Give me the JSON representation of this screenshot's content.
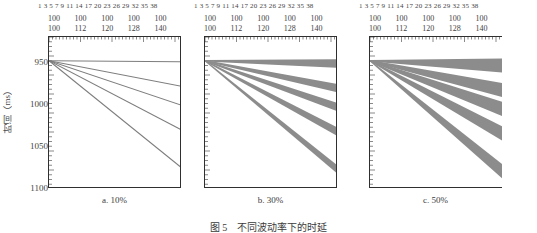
{
  "figure": {
    "title": "图 5　不同波动率下的时延",
    "y_axis_label": "时间（ms）",
    "y_ticks": [
      "950",
      "1000",
      "1050",
      "1100"
    ],
    "y_tick_values": [
      950,
      1000,
      1050,
      1100
    ],
    "top_index_row": "1 3 5 7 9 11 14 17 20 23 26 29 32 35 38",
    "top_row_a": [
      "100",
      "100",
      "100",
      "100",
      "100"
    ],
    "top_row_b": [
      "100",
      "112",
      "120",
      "128",
      "140"
    ],
    "panels": [
      {
        "caption": "a. 10%",
        "percent": "10%"
      },
      {
        "caption": "b. 30%",
        "percent": "30%"
      },
      {
        "caption": "c. 50%",
        "percent": "50%"
      }
    ]
  },
  "chart_data": {
    "type": "line",
    "title": "图 5　不同波动率下的时延",
    "xlabel": "",
    "ylabel": "时间（ms）",
    "ylim": [
      1100,
      940
    ],
    "y_ticks": [
      950,
      1000,
      1050,
      1100
    ],
    "x": [
      0,
      1
    ],
    "xlim": [
      0,
      1
    ],
    "grid": false,
    "legend": "none",
    "band_color": "#8c8c8c",
    "line_color": "#7d7d7d",
    "panels": [
      {
        "name": "a. 10%",
        "volatility": "10%",
        "band_half_width_ms": 1.2,
        "series": [
          {
            "name": "s1",
            "start": 965,
            "end": 966
          },
          {
            "name": "s2",
            "start": 965,
            "end": 992
          },
          {
            "name": "s3",
            "start": 965,
            "end": 1012
          },
          {
            "name": "s4",
            "start": 965,
            "end": 1038
          },
          {
            "name": "s5",
            "start": 965,
            "end": 1078
          }
        ]
      },
      {
        "name": "b. 30%",
        "volatility": "30%",
        "band_half_width_ms": 4.5,
        "series": [
          {
            "name": "s1",
            "start": 965,
            "end": 968
          },
          {
            "name": "s2",
            "start": 965,
            "end": 994
          },
          {
            "name": "s3",
            "start": 965,
            "end": 1014
          },
          {
            "name": "s4",
            "start": 965,
            "end": 1040
          },
          {
            "name": "s5",
            "start": 965,
            "end": 1080
          }
        ]
      },
      {
        "name": "c. 50%",
        "volatility": "50%",
        "band_half_width_ms": 7.5,
        "series": [
          {
            "name": "s1",
            "start": 965,
            "end": 970
          },
          {
            "name": "s2",
            "start": 965,
            "end": 996
          },
          {
            "name": "s3",
            "start": 965,
            "end": 1016
          },
          {
            "name": "s4",
            "start": 965,
            "end": 1042
          },
          {
            "name": "s5",
            "start": 965,
            "end": 1082
          }
        ]
      }
    ]
  }
}
